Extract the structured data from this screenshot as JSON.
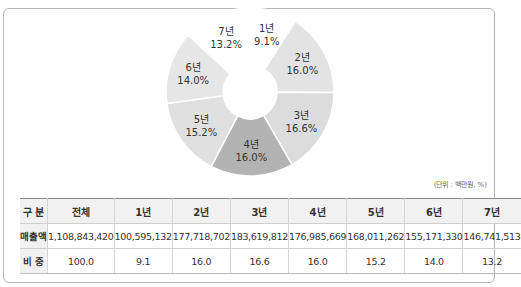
{
  "chart_data": {
    "type": "pie",
    "variant": "donut",
    "title": "",
    "unit_note": "(단위 : 백만원, %)",
    "categories": [
      "1년",
      "2년",
      "3년",
      "4년",
      "5년",
      "6년",
      "7년"
    ],
    "values": [
      9.1,
      16.0,
      16.6,
      16.0,
      15.2,
      14.0,
      13.2
    ],
    "labels": [
      "9.1%",
      "16.0%",
      "16.6%",
      "16.0%",
      "15.2%",
      "14.0%",
      "13.2%"
    ],
    "colors": [
      "#ffffff",
      "#e3e3e3",
      "#dcdcdc",
      "#b3b3b3",
      "#e0e0e0",
      "#e6e6e6",
      "#ffffff"
    ],
    "start_angle_deg": 0,
    "direction": "clockwise"
  },
  "table": {
    "headers": [
      "구 분",
      "전체",
      "1년",
      "2년",
      "3년",
      "4년",
      "5년",
      "6년",
      "7년"
    ],
    "rows": [
      {
        "label": "매출액",
        "values": [
          "1,108,843,420",
          "100,595,132",
          "177,718,702",
          "183,619,812",
          "176,985,669",
          "168,011,262",
          "155,171,330",
          "146,741,513"
        ]
      },
      {
        "label": "비 중",
        "values": [
          "100.0",
          "9.1",
          "16.0",
          "16.6",
          "16.0",
          "15.2",
          "14.0",
          "13.2"
        ]
      }
    ]
  }
}
